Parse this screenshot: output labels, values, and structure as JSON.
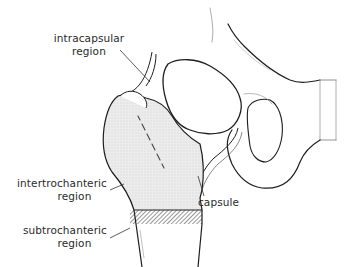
{
  "figure": {
    "labels": {
      "intracapsular": {
        "line1": "intracapsular",
        "line2": "region"
      },
      "intertrochanteric": {
        "line1": "intertrochanteric",
        "line2": "region"
      },
      "subtrochanteric": {
        "line1": "subtrochanteric",
        "line2": "region"
      },
      "capsule": {
        "line1": "capsule"
      }
    },
    "colors": {
      "outline": "#1e1e1e",
      "stipple_fill": "#e8e8e8",
      "hatch": "#333333",
      "background": "#ffffff"
    }
  }
}
